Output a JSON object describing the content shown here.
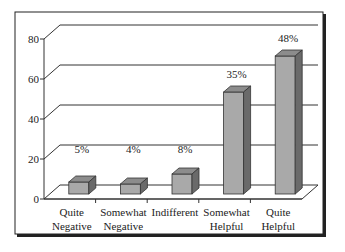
{
  "chart_data": {
    "type": "bar",
    "title": "",
    "xlabel": "",
    "ylabel": "",
    "categories": [
      [
        "Quite",
        "Negative"
      ],
      [
        "Somewhat",
        "Negative"
      ],
      [
        "Indifferent"
      ],
      [
        "Somewhat",
        "Helpful"
      ],
      [
        "Quite",
        "Helpful"
      ]
    ],
    "values": [
      6,
      5,
      10,
      51,
      69
    ],
    "data_labels": [
      "5%",
      "4%",
      "8%",
      "35%",
      "48%"
    ],
    "ylim": [
      0,
      80
    ],
    "yticks": [
      0,
      20,
      40,
      60,
      80
    ],
    "ytick_labels": [
      "0",
      "20",
      "40",
      "60",
      "80"
    ],
    "grid": true,
    "legend": "none",
    "style": "3d-column",
    "colors": {
      "bar_front": "#a9a9a9",
      "bar_top": "#8c8c8c",
      "bar_side": "#6a6a6a",
      "axis": "#333333",
      "frame": "#222222",
      "background": "#ffffff"
    }
  }
}
